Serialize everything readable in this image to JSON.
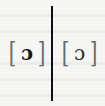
{
  "figure": {
    "left": {
      "open_bracket": "[",
      "symbol": "ɔ",
      "close_bracket": "]",
      "style": "bold"
    },
    "separator": "|",
    "right": {
      "open_bracket": "[",
      "symbol": "ɔ",
      "close_bracket": "]",
      "style": "regular"
    }
  },
  "colors": {
    "background": "#f5f5f3",
    "divider": "#111111",
    "brackets": "#6a6a6a",
    "glyph": "#222222"
  }
}
